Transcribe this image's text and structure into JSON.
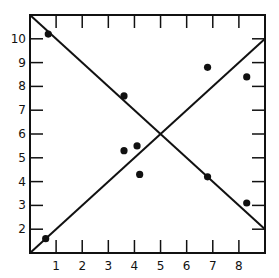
{
  "chart_data": {
    "type": "scatter",
    "title": "",
    "xlabel": "",
    "ylabel": "",
    "xlim": [
      0,
      9
    ],
    "ylim": [
      1,
      11
    ],
    "grid": false,
    "x_ticks": [
      1,
      2,
      3,
      4,
      5,
      6,
      7,
      8
    ],
    "y_ticks": [
      2,
      3,
      4,
      5,
      6,
      7,
      8,
      9,
      10
    ],
    "series": [
      {
        "name": "points",
        "x": [
          0.7,
          0.6,
          3.6,
          3.6,
          4.1,
          4.2,
          6.8,
          6.8,
          8.3,
          8.3
        ],
        "y": [
          10.2,
          1.6,
          7.6,
          5.3,
          5.5,
          4.3,
          8.8,
          4.2,
          8.4,
          3.1
        ]
      }
    ],
    "lines": [
      {
        "name": "increasing-line",
        "x": [
          0,
          9
        ],
        "y": [
          1,
          10
        ]
      },
      {
        "name": "decreasing-line",
        "x": [
          0,
          9
        ],
        "y": [
          11,
          2
        ]
      }
    ]
  }
}
